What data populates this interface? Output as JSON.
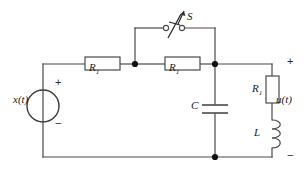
{
  "figure": {
    "background_color": "#ffffff",
    "line_color": "#4a4a4a",
    "text_color": "#1a1a1a"
  },
  "labels": {
    "source": "x(t)",
    "output": "u(t)",
    "resistor_1": "R",
    "resistor_1_sub": "1",
    "resistor_2": "R",
    "resistor_2_sub": "1",
    "resistor_3": "R",
    "resistor_3_sub": "1",
    "capacitor": "C",
    "inductor": "L",
    "switch": "S"
  },
  "polarity": {
    "source_plus": "+",
    "source_minus": "−",
    "output_plus": "+",
    "output_minus": "−"
  },
  "components": [
    {
      "name": "voltage-source",
      "type": "source",
      "label": "x(t)",
      "orientation": "vertical"
    },
    {
      "name": "resistor-r1-left",
      "type": "resistor",
      "label": "R1",
      "orientation": "horizontal"
    },
    {
      "name": "resistor-r1-middle",
      "type": "resistor",
      "label": "R1",
      "orientation": "horizontal"
    },
    {
      "name": "switch-s",
      "type": "switch",
      "label": "S",
      "state": "open",
      "orientation": "horizontal"
    },
    {
      "name": "capacitor-c",
      "type": "capacitor",
      "label": "C",
      "orientation": "vertical"
    },
    {
      "name": "resistor-r1-right",
      "type": "resistor",
      "label": "R1",
      "orientation": "vertical"
    },
    {
      "name": "inductor-l",
      "type": "inductor",
      "label": "L",
      "orientation": "vertical",
      "coils": 3
    }
  ],
  "nodes": [
    {
      "name": "node-switch-left",
      "x": 135,
      "y": 64
    },
    {
      "name": "node-right-top",
      "x": 215,
      "y": 64
    },
    {
      "name": "node-bottom",
      "x": 215,
      "y": 157
    }
  ]
}
